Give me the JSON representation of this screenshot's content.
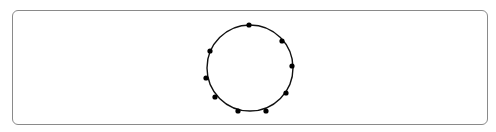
{
  "diagram": {
    "type": "circle-with-points",
    "circle": {
      "cx": 250,
      "cy": 68,
      "r": 43,
      "stroke": "#111111"
    },
    "points": [
      {
        "x": 249,
        "y": 25
      },
      {
        "x": 282,
        "y": 41
      },
      {
        "x": 292,
        "y": 66
      },
      {
        "x": 286,
        "y": 93
      },
      {
        "x": 266,
        "y": 111
      },
      {
        "x": 238,
        "y": 111
      },
      {
        "x": 215,
        "y": 97
      },
      {
        "x": 206,
        "y": 78
      },
      {
        "x": 210,
        "y": 51
      }
    ],
    "point_count": 9,
    "point_color": "#000000"
  }
}
